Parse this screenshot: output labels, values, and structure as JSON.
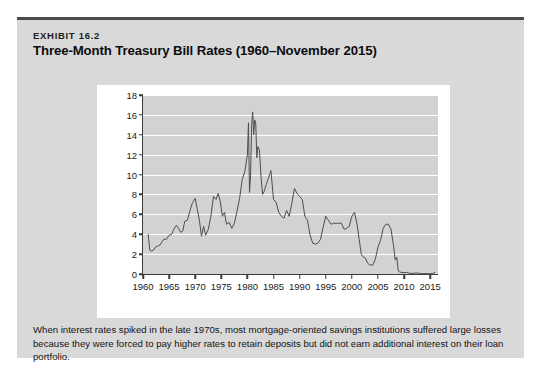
{
  "exhibit": {
    "kicker": "EXHIBIT 16.2",
    "title": "Three-Month Treasury Bill Rates (1960–November 2015)",
    "caption": "When interest rates spiked in the late 1970s, most mortgage-oriented savings institutions suffered large losses because they were forced to pay higher rates to retain deposits but did not earn additional interest on their loan portfolio."
  },
  "colors": {
    "panel_background": "#d9d9d9",
    "panel_top_rule": "#4b4b4b",
    "card_background": "#ffffff",
    "plot_background": "#d2d2d2",
    "gridline": "#ffffff",
    "axis": "#3a3a3a",
    "series_line": "#4d4d4d",
    "text": "#141414"
  },
  "chart_data": {
    "type": "line",
    "title": "Three-Month Treasury Bill Rates (1960–November 2015)",
    "xlabel": "",
    "ylabel": "",
    "xlim": [
      1960,
      2016.5
    ],
    "ylim": [
      0,
      18
    ],
    "grid": true,
    "legend": null,
    "yticks": [
      0,
      2,
      4,
      6,
      8,
      10,
      12,
      14,
      16,
      18
    ],
    "ytick_labels": [
      "0",
      "2",
      "4",
      "6",
      "8",
      "10",
      "12",
      "14",
      "16",
      "18"
    ],
    "xticks": [
      1960,
      1965,
      1970,
      1975,
      1980,
      1985,
      1990,
      1995,
      2000,
      2005,
      2010,
      2015
    ],
    "xtick_labels": [
      "1960",
      "1965",
      "1970",
      "1975",
      "1980",
      "1985",
      "1990",
      "1995",
      "2000",
      "2005",
      "2010",
      "2015"
    ],
    "series": [
      {
        "name": "3-Month Treasury Bill Rate",
        "x": [
          1961.0,
          1961.3,
          1961.6,
          1962.0,
          1962.4,
          1962.8,
          1963.2,
          1963.6,
          1964.0,
          1964.5,
          1965.0,
          1965.5,
          1966.0,
          1966.4,
          1966.8,
          1967.2,
          1967.6,
          1968.0,
          1968.5,
          1969.0,
          1969.5,
          1970.0,
          1970.4,
          1970.8,
          1971.2,
          1971.6,
          1972.0,
          1972.5,
          1973.0,
          1973.5,
          1974.0,
          1974.4,
          1974.8,
          1975.2,
          1975.6,
          1976.0,
          1976.5,
          1977.0,
          1977.5,
          1978.0,
          1978.5,
          1979.0,
          1979.5,
          1980.0,
          1980.2,
          1980.4,
          1980.6,
          1980.8,
          1981.0,
          1981.2,
          1981.4,
          1981.6,
          1981.8,
          1982.0,
          1982.3,
          1982.6,
          1982.9,
          1983.2,
          1983.6,
          1984.0,
          1984.5,
          1985.0,
          1985.5,
          1986.0,
          1986.5,
          1987.0,
          1987.5,
          1988.0,
          1988.5,
          1989.0,
          1989.5,
          1990.0,
          1990.5,
          1991.0,
          1991.5,
          1992.0,
          1992.5,
          1993.0,
          1993.5,
          1994.0,
          1994.5,
          1995.0,
          1995.5,
          1996.0,
          1996.5,
          1997.0,
          1997.5,
          1998.0,
          1998.5,
          1999.0,
          1999.5,
          2000.0,
          2000.5,
          2001.0,
          2001.4,
          2001.8,
          2002.2,
          2002.6,
          2003.0,
          2003.5,
          2004.0,
          2004.5,
          2005.0,
          2005.5,
          2006.0,
          2006.5,
          2007.0,
          2007.5,
          2008.0,
          2008.3,
          2008.6,
          2008.9,
          2009.2,
          2009.6,
          2010.0,
          2010.5,
          2011.0,
          2011.5,
          2012.0,
          2012.5,
          2013.0,
          2013.5,
          2014.0,
          2014.5,
          2015.0,
          2015.5,
          2015.9
        ],
        "y": [
          4.0,
          2.4,
          2.3,
          2.4,
          2.7,
          2.8,
          2.9,
          3.2,
          3.5,
          3.5,
          3.9,
          4.0,
          4.6,
          4.9,
          4.6,
          4.2,
          4.3,
          5.3,
          5.4,
          6.4,
          7.2,
          7.6,
          6.5,
          5.4,
          3.8,
          4.8,
          3.9,
          4.5,
          5.8,
          7.8,
          7.5,
          8.1,
          7.3,
          5.8,
          6.2,
          5.0,
          5.2,
          4.6,
          5.1,
          6.3,
          7.6,
          9.5,
          10.3,
          12.0,
          15.2,
          8.2,
          9.9,
          14.8,
          16.3,
          14.0,
          15.5,
          15.1,
          11.7,
          12.8,
          12.5,
          9.8,
          8.0,
          8.3,
          9.0,
          9.6,
          10.4,
          7.5,
          7.2,
          6.2,
          5.8,
          5.6,
          6.4,
          5.8,
          7.1,
          8.6,
          8.1,
          7.8,
          7.5,
          5.8,
          5.4,
          3.9,
          3.1,
          3.0,
          3.1,
          3.5,
          4.7,
          5.8,
          5.4,
          5.0,
          5.1,
          5.1,
          5.1,
          5.1,
          4.5,
          4.6,
          4.8,
          5.8,
          6.2,
          5.0,
          3.5,
          2.0,
          1.7,
          1.6,
          1.1,
          0.9,
          0.9,
          1.5,
          2.7,
          3.4,
          4.6,
          5.0,
          5.0,
          4.5,
          2.8,
          1.4,
          1.7,
          0.3,
          0.2,
          0.15,
          0.14,
          0.16,
          0.08,
          0.05,
          0.09,
          0.1,
          0.06,
          0.04,
          0.04,
          0.03,
          0.03,
          0.05,
          0.15
        ]
      }
    ]
  }
}
